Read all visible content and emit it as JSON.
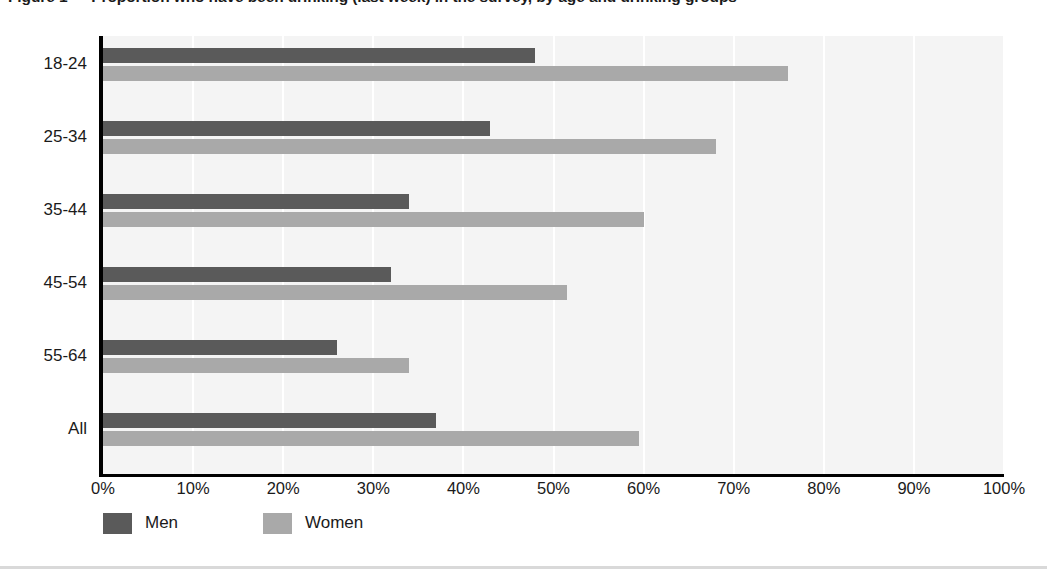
{
  "chart_data": {
    "type": "bar",
    "orientation": "horizontal",
    "title": "Figure 1 — Proportion who have been drinking (last week) in the survey, by age and drinking groups",
    "xlabel": "",
    "ylabel": "",
    "xlim": [
      0,
      100
    ],
    "xtick_labels": [
      "0%",
      "10%",
      "20%",
      "30%",
      "40%",
      "50%",
      "60%",
      "70%",
      "80%",
      "90%",
      "100%"
    ],
    "xtick_values": [
      0,
      10,
      20,
      30,
      40,
      50,
      60,
      70,
      80,
      90,
      100
    ],
    "categories": [
      "18-24",
      "25-34",
      "35-44",
      "45-54",
      "55-64",
      "All"
    ],
    "grid": "vertical-white-gridlines",
    "legend_position": "below-axis-left",
    "series": [
      {
        "name": "Men",
        "color": "#5a5a5a",
        "values": [
          48,
          43,
          34,
          32,
          26,
          37
        ]
      },
      {
        "name": "Women",
        "color": "#a9a9a9",
        "values": [
          76,
          68,
          60,
          51.5,
          34,
          59.5
        ]
      }
    ],
    "plot_background": "#f4f4f4",
    "gridline_color": "#ffffff",
    "axis_color": "#000000"
  }
}
